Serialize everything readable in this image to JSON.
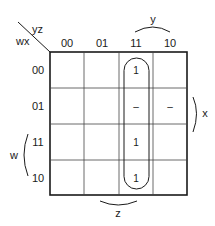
{
  "kmap": {
    "row_var_label": "wx",
    "col_var_label": "yz",
    "col_headers": [
      "00",
      "01",
      "11",
      "10"
    ],
    "row_headers": [
      "00",
      "01",
      "11",
      "10"
    ],
    "cells": [
      [
        "",
        "",
        "1",
        ""
      ],
      [
        "",
        "",
        "–",
        "–"
      ],
      [
        "",
        "",
        "1",
        ""
      ],
      [
        "",
        "",
        "1",
        ""
      ]
    ],
    "brace_labels": {
      "top": "y",
      "right": "x",
      "left": "w",
      "bottom": "z"
    },
    "groups": [
      {
        "description": "column yz=11, all rows",
        "color": "#1a1a1a"
      }
    ]
  }
}
